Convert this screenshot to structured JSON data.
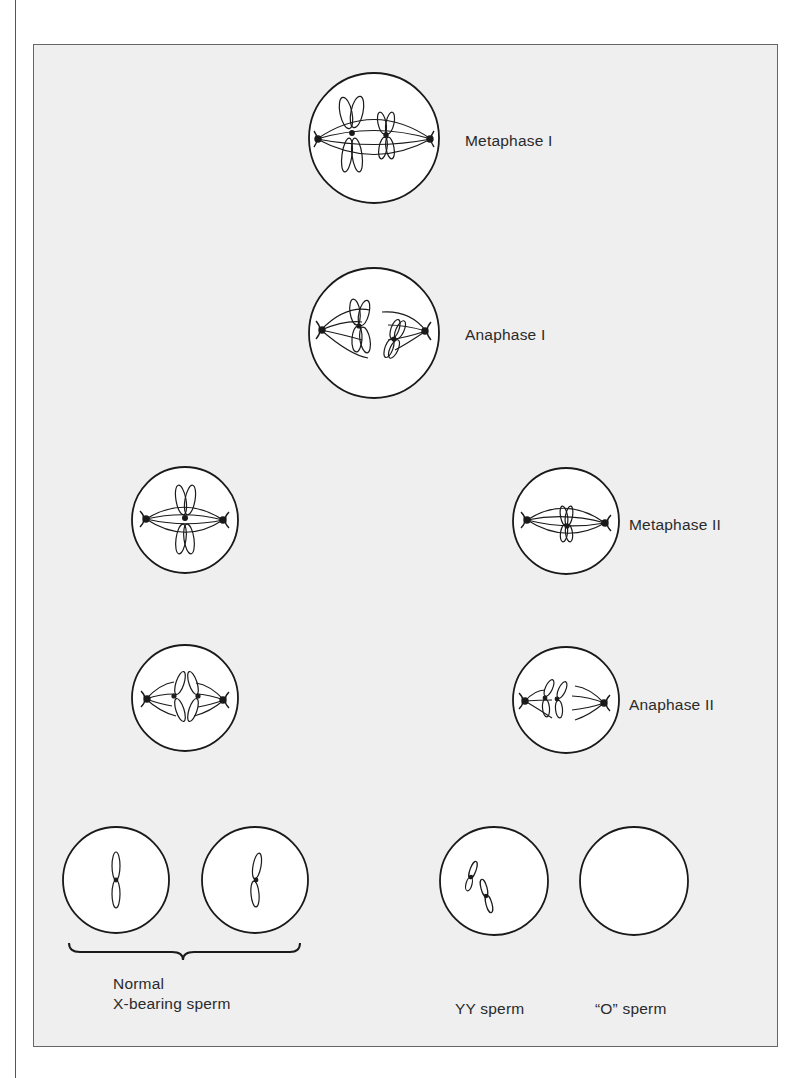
{
  "figure": {
    "stages": [
      {
        "id": "metaphase-1",
        "label": "Metaphase I"
      },
      {
        "id": "anaphase-1",
        "label": "Anaphase I"
      },
      {
        "id": "metaphase-2",
        "label": "Metaphase II"
      },
      {
        "id": "anaphase-2",
        "label": "Anaphase II"
      }
    ],
    "products": [
      {
        "id": "normal-x",
        "label_line1": "Normal",
        "label_line2": "X-bearing sperm"
      },
      {
        "id": "yy",
        "label": "YY sperm"
      },
      {
        "id": "o",
        "label": "“O” sperm"
      }
    ]
  },
  "colors": {
    "background": "#efefef",
    "ink": "#1a1a1a"
  }
}
